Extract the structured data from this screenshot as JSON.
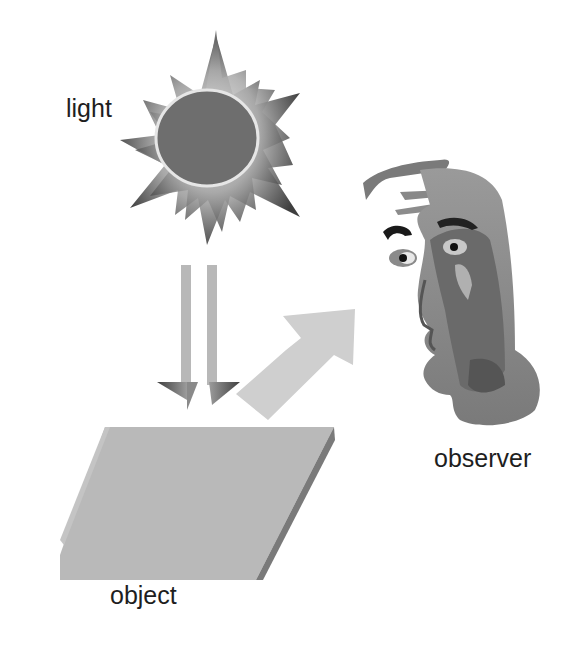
{
  "diagram": {
    "labels": {
      "light": "light",
      "observer": "observer",
      "object": "object"
    },
    "elements": [
      {
        "id": "light-source",
        "shape": "sun-icon",
        "label": "light"
      },
      {
        "id": "incident-light",
        "shape": "double-down-arrow",
        "from": "light-source",
        "to": "object"
      },
      {
        "id": "reflected-light",
        "shape": "diagonal-arrow",
        "from": "object",
        "to": "observer"
      },
      {
        "id": "object",
        "shape": "slanted-slab",
        "label": "object"
      },
      {
        "id": "observer",
        "shape": "face-icon",
        "label": "observer"
      }
    ],
    "colors": {
      "background": "#ffffff",
      "sun_core": "#6e6e6e",
      "sun_rays_dark": "#505050",
      "sun_rays_light": "#d0d0d0",
      "incident_arrow": "#b4b4b4",
      "reflected_arrow": "#cfcfcf",
      "slab_top": "#b8b8b8",
      "slab_edge": "#7a7a7a",
      "face_skin": "#7d7d7d",
      "face_dark": "#555555",
      "text": "#1e1e1e"
    }
  }
}
